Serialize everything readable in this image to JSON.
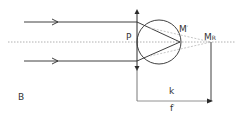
{
  "diagram": {
    "title": "",
    "labels": {
      "figure_letter": "B",
      "lens_point": "P",
      "image_point": "M",
      "image_point_prime": "′",
      "far_point": "M",
      "far_point_sub": "R",
      "distance_k": "k",
      "focal_length": "f",
      "focal_length_prime": "′"
    },
    "colors": {
      "line": "#2a2a2a",
      "axis": "#b0b0b0",
      "dashed": "#b8b8b8",
      "text": "#333333"
    }
  }
}
